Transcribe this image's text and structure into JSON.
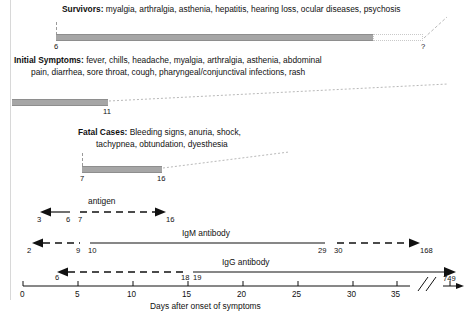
{
  "figure": {
    "type": "timeline",
    "xlabel": "Days after onset of symptoms",
    "axis_ticks": [
      "0",
      "5",
      "10",
      "15",
      "20",
      "25",
      "30",
      "35"
    ],
    "axis_break_symbol": "//"
  },
  "phases": [
    {
      "id": "survivors",
      "title": "Survivors:",
      "text": " myalgia, arthralgia, asthenia, hepatitis, hearing loss, ocular diseases, psychosis",
      "start_label": "6",
      "end_label": "?",
      "start_day": 6,
      "end_day": 34,
      "uncertain": true
    },
    {
      "id": "initial-symptoms",
      "title": "Initial Symptoms:",
      "text": " fever, chills, headache, myalgia, arthralgia, asthenia, abdominal",
      "text_line2": "pain, diarrhea, sore throat, cough, pharyngeal/conjunctival infections, rash",
      "start_label": "",
      "end_label": "11",
      "start_day": 0,
      "end_day": 11
    },
    {
      "id": "fatal-cases",
      "title": "Fatal Cases:",
      "text": " Bleeding signs, anuria, shock,",
      "text_line2": "tachypnea, obtundation, dyesthesia",
      "start_label": "7",
      "end_label": "16",
      "start_day": 7,
      "end_day": 16
    }
  ],
  "markers": [
    {
      "id": "antigen",
      "label": "antigen",
      "left_label": "3",
      "left_inner_label": "6",
      "right_inner_label": "7",
      "right_label": "16"
    },
    {
      "id": "igm",
      "label": "IgM antibody",
      "left_label": "2",
      "left_inner_label": "9",
      "right_inner_label": "10",
      "solid_end_label": "29",
      "dash_start_label": "30",
      "right_label": "168"
    },
    {
      "id": "igg",
      "label": "IgG antibody",
      "left_label": "6",
      "left_inner_label": "18",
      "right_inner_label": "19",
      "right_label": "749"
    }
  ],
  "colors": {
    "bar": "#a6a6a6",
    "line": "#111111",
    "dotted": "#c9c9c9"
  }
}
